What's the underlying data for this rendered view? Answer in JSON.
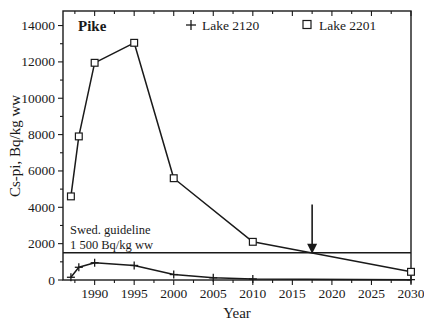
{
  "chart_data": {
    "type": "line",
    "title": "Pike",
    "xlabel": "Year",
    "ylabel": "Cs-pi, Bq/kg ww",
    "xlim": [
      1986,
      2030
    ],
    "ylim": [
      0,
      14800
    ],
    "grid": false,
    "legend_position": "top-inside",
    "xticks": [
      1990,
      1995,
      2000,
      2005,
      2010,
      2015,
      2020,
      2025,
      2030
    ],
    "yticks": [
      0,
      2000,
      4000,
      6000,
      8000,
      10000,
      12000,
      14000
    ],
    "xtick_labels": [
      "1990",
      "1995",
      "2000",
      "2005",
      "2010",
      "2015",
      "2020",
      "2025",
      "2030"
    ],
    "ytick_labels": [
      "0",
      "2000",
      "4000",
      "6000",
      "8000",
      "10000",
      "12000",
      "14000"
    ],
    "series": [
      {
        "name": "Lake 2201",
        "marker": "square",
        "x": [
          1987,
          1988,
          1990,
          1995,
          2000,
          2010,
          2030
        ],
        "values": [
          4600,
          7900,
          11950,
          13050,
          5600,
          2100,
          450
        ]
      },
      {
        "name": "Lake 2120",
        "marker": "plus",
        "x": [
          1987,
          1988,
          1990,
          1995,
          2000,
          2005,
          2010,
          2030
        ],
        "values": [
          150,
          700,
          950,
          800,
          300,
          120,
          60,
          20
        ]
      }
    ],
    "reference_lines": [
      {
        "name": "Swedish guideline",
        "orientation": "horizontal",
        "value": 1500,
        "label_line1": "Swed. guideline",
        "label_line2": "1 500 Bq/kg ww"
      }
    ],
    "annotations": [
      {
        "type": "arrow",
        "direction": "down",
        "x": 2017.5,
        "y": 1500,
        "note": "crossing of Lake 2201 with guideline"
      }
    ],
    "colors": {
      "foreground": "#1a1a1a",
      "background": "#ffffff",
      "marker_fill": "#ffffff"
    }
  },
  "legend": {
    "entries": [
      {
        "label": "Lake 2120",
        "marker": "plus"
      },
      {
        "label": "Lake 2201",
        "marker": "square"
      }
    ]
  },
  "labels": {
    "title": "Pike",
    "x_axis_title": "Year",
    "y_axis_title": "Cs-pi, Bq/kg ww",
    "annotation_line1": "Swed. guideline",
    "annotation_line2": "1 500 Bq/kg ww"
  }
}
